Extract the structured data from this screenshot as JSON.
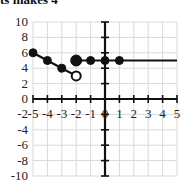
{
  "header": {
    "partial_text": "ts makes 4"
  },
  "chart_data": {
    "type": "line",
    "title": "",
    "xlabel": "",
    "ylabel": "",
    "xlim": [
      -5,
      5
    ],
    "ylim": [
      -10,
      10
    ],
    "grid": true,
    "x_ticks": [
      "-5",
      "-4",
      "-3",
      "-2",
      "-1",
      "0",
      "1",
      "2",
      "3",
      "4",
      "5"
    ],
    "y_ticks": [
      "10",
      "8",
      "6",
      "4",
      "2",
      "0",
      "-2",
      "-4",
      "-6",
      "-8",
      "-10"
    ],
    "series": [
      {
        "name": "segment-1",
        "points": [
          [
            -5,
            6
          ],
          [
            -4,
            5
          ],
          [
            -3,
            4
          ],
          [
            -2,
            3
          ]
        ],
        "endpoints": {
          "left": "closed",
          "right": "open"
        },
        "markers": [
          {
            "x": -5,
            "y": 6,
            "style": "closed"
          },
          {
            "x": -4,
            "y": 5,
            "style": "closed"
          },
          {
            "x": -3,
            "y": 4,
            "style": "closed"
          },
          {
            "x": -2,
            "y": 3,
            "style": "open"
          }
        ]
      },
      {
        "name": "segment-2",
        "points": [
          [
            -2,
            5
          ],
          [
            5,
            5
          ]
        ],
        "endpoints": {
          "left": "closed",
          "right": "continues"
        },
        "markers": [
          {
            "x": -2,
            "y": 5,
            "style": "closed"
          },
          {
            "x": -1,
            "y": 5,
            "style": "closed"
          },
          {
            "x": 0,
            "y": 5,
            "style": "closed"
          },
          {
            "x": 1,
            "y": 5,
            "style": "closed"
          }
        ]
      }
    ]
  }
}
